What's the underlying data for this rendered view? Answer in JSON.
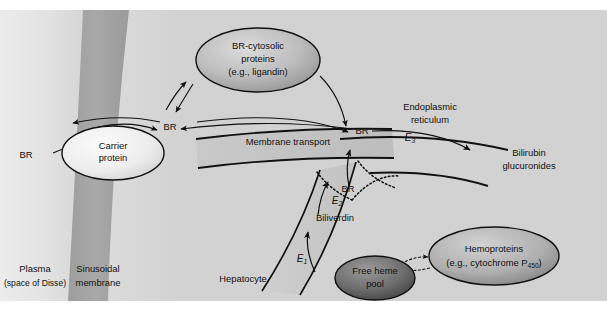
{
  "figure": {
    "type": "biological-pathway-diagram",
    "title_visible": false,
    "background_color": "#d4d4d4",
    "regions": {
      "plasma": {
        "label_line1": "Plasma",
        "label_line2": "(space of Disse)",
        "fill": "#dcdcdc"
      },
      "membrane": {
        "label_line1": "Sinusoidal",
        "label_line2": "membrane",
        "fill": "#a8a8a8"
      },
      "hepatocyte": {
        "label": "Hepatocyte",
        "fill": "#d4d4d4"
      }
    },
    "nodes": {
      "carrier_protein": {
        "line1": "Carrier",
        "line2": "protein",
        "shape": "ellipse",
        "fill_center": "#f4f4f4",
        "fill_edge": "#cccccc"
      },
      "br_cytosolic": {
        "line1": "BR-cytosolic",
        "line2": "proteins",
        "line3": "(e.g., ligandin)",
        "shape": "ellipse",
        "fill_center": "#d8d8d8",
        "fill_edge": "#8e8e8e"
      },
      "free_heme_pool": {
        "line1": "Free heme",
        "line2": "pool",
        "shape": "ellipse",
        "fill_center": "#8a8a8a",
        "fill_edge": "#4a4a4a"
      },
      "hemoproteins": {
        "line1": "Hemoproteins",
        "line2_prefix": "(e.g., cytochrome P",
        "line2_sub": "450",
        "line2_suffix": ")",
        "shape": "ellipse",
        "fill_center": "#c8c8c8",
        "fill_edge": "#7e7e7e"
      }
    },
    "labels": {
      "br_plasma": "BR",
      "br_cytosol": "BR",
      "br_er": "BR",
      "br_biliverdin_product": "BR",
      "membrane_transport": "Membrane transport",
      "endoplasmic_reticulum_line1": "Endoplasmic",
      "endoplasmic_reticulum_line2": "reticulum",
      "bilirubin_glucuronides_line1": "Bilirubin",
      "bilirubin_glucuronides_line2": "glucuronides",
      "biliverdin": "Biliverdin"
    },
    "enzymes": [
      {
        "id": "E1",
        "symbol": "E",
        "subscript": "1",
        "position": "heme-to-biliverdin"
      },
      {
        "id": "E2",
        "symbol": "E",
        "subscript": "2",
        "position": "biliverdin-to-BR"
      },
      {
        "id": "E3",
        "symbol": "E",
        "subscript": "3",
        "position": "BR-to-glucuronides"
      }
    ]
  }
}
